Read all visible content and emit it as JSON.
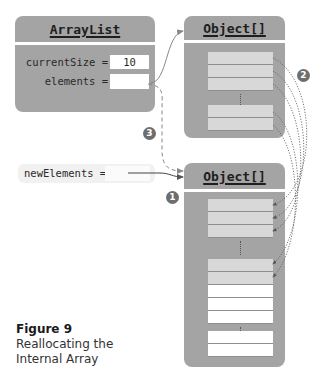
{
  "arraylist": {
    "title": "ArrayList",
    "fields": [
      {
        "label": "currentSize =",
        "value": "10"
      },
      {
        "label": "elements =",
        "value": ""
      }
    ]
  },
  "old_array": {
    "title": "Object[]",
    "filled_cells": 5,
    "empty_cells": 0
  },
  "new_array": {
    "title": "Object[]",
    "filled_cells": 5,
    "empty_cells": 5
  },
  "new_elements": {
    "label": "newElements =",
    "value": ""
  },
  "badges": {
    "step1": "1",
    "step2": "2",
    "step3": "3"
  },
  "caption": {
    "title": "Figure 9",
    "line1": "Reallocating the",
    "line2": "Internal Array"
  },
  "colors": {
    "box": "#a4a4a4",
    "cell_filled": "#d8d8d8",
    "cell_empty": "#ffffff",
    "badge": "#6e6e6e"
  }
}
